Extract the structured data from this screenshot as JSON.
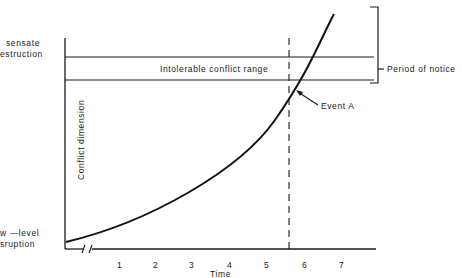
{
  "diagram": {
    "y_axis_label": "Conflict dimension",
    "x_axis_label": "Time",
    "x_ticks": [
      "1",
      "2",
      "3",
      "4",
      "5",
      "6",
      "7"
    ],
    "y_levels": {
      "top_label_line1": "sensate",
      "top_label_line2": "estruction",
      "bottom_label_line1": "w —level",
      "bottom_label_line2": "sruption"
    },
    "band_label": "Intolerable conflict range",
    "bracket_label": "Period of notice",
    "event_label": "Event A",
    "axis_break": "//"
  }
}
